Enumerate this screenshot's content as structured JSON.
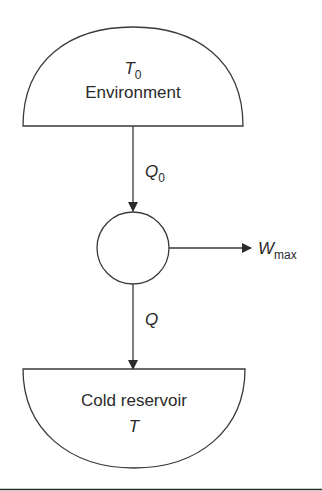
{
  "diagram": {
    "type": "thermodynamic energy flow",
    "environment": {
      "symbol": "T",
      "symbol_subscript": "0",
      "label": "Environment"
    },
    "heat_in": {
      "symbol": "Q",
      "symbol_subscript": "0"
    },
    "engine": {
      "shape": "circle"
    },
    "work_out": {
      "symbol": "W",
      "symbol_subscript": "max"
    },
    "heat_out": {
      "symbol": "Q"
    },
    "cold_reservoir": {
      "label": "Cold reservoir",
      "symbol": "T"
    },
    "colors": {
      "stroke": "#3a3a3a",
      "text": "#2a2a2a",
      "background": "#ffffff"
    }
  }
}
